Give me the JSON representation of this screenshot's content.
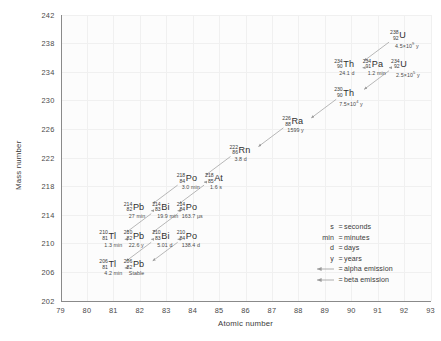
{
  "chart_data": {
    "type": "scatter",
    "title": "",
    "xlabel": "Atomic number",
    "ylabel": "Mass number",
    "xlim": [
      79,
      93
    ],
    "ylim": [
      202,
      242
    ],
    "xticks": [
      79,
      80,
      81,
      82,
      83,
      84,
      85,
      86,
      87,
      88,
      89,
      90,
      91,
      92,
      93
    ],
    "yticks": [
      202,
      206,
      210,
      214,
      218,
      222,
      226,
      230,
      234,
      238,
      242
    ],
    "grid": true,
    "legend_position": "lower-right",
    "points": [
      {
        "label": "U",
        "symbol": "U",
        "mass": 238,
        "z": 92,
        "half_life": "4.5×10⁹ y",
        "hl_base": "4.5×10",
        "hl_exp": "9",
        "hl_unit": " y"
      },
      {
        "label": "Th",
        "symbol": "Th",
        "mass": 234,
        "z": 90,
        "half_life": "24.1 d",
        "hl_base": "24.1 d",
        "hl_exp": "",
        "hl_unit": ""
      },
      {
        "label": "Pa",
        "symbol": "Pa",
        "mass": 234,
        "z": 91,
        "half_life": "1.2 min",
        "hl_base": "1.2 min",
        "hl_exp": "",
        "hl_unit": ""
      },
      {
        "label": "U",
        "symbol": "U",
        "mass": 234,
        "z": 92,
        "half_life": "2.5×10⁵ y",
        "hl_base": "2.5×10",
        "hl_exp": "5",
        "hl_unit": " y"
      },
      {
        "label": "Th",
        "symbol": "Th",
        "mass": 230,
        "z": 90,
        "half_life": "7.5×10⁴ y",
        "hl_base": "7.5×10",
        "hl_exp": "4",
        "hl_unit": " y"
      },
      {
        "label": "Ra",
        "symbol": "Ra",
        "mass": 226,
        "z": 88,
        "half_life": "1599 y",
        "hl_base": "1599 y",
        "hl_exp": "",
        "hl_unit": ""
      },
      {
        "label": "Rn",
        "symbol": "Rn",
        "mass": 222,
        "z": 86,
        "half_life": "3.8 d",
        "hl_base": "3.8 d",
        "hl_exp": "",
        "hl_unit": ""
      },
      {
        "label": "Po",
        "symbol": "Po",
        "mass": 218,
        "z": 84,
        "half_life": "3.0 min",
        "hl_base": "3.0 min",
        "hl_exp": "",
        "hl_unit": ""
      },
      {
        "label": "At",
        "symbol": "At",
        "mass": 218,
        "z": 85,
        "half_life": "1.6 s",
        "hl_base": "1.6 s",
        "hl_exp": "",
        "hl_unit": ""
      },
      {
        "label": "Pb",
        "symbol": "Pb",
        "mass": 214,
        "z": 82,
        "half_life": "27 min",
        "hl_base": "27 min",
        "hl_exp": "",
        "hl_unit": ""
      },
      {
        "label": "Bi",
        "symbol": "Bi",
        "mass": 214,
        "z": 83,
        "half_life": "19.9 min",
        "hl_base": "19.9 min",
        "hl_exp": "",
        "hl_unit": ""
      },
      {
        "label": "Po",
        "symbol": "Po",
        "mass": 214,
        "z": 84,
        "half_life": "163.7 µs",
        "hl_base": "163.7 µs",
        "hl_exp": "",
        "hl_unit": ""
      },
      {
        "label": "Tl",
        "symbol": "Tl",
        "mass": 210,
        "z": 81,
        "half_life": "1.3 min",
        "hl_base": "1.3 min",
        "hl_exp": "",
        "hl_unit": ""
      },
      {
        "label": "Pb",
        "symbol": "Pb",
        "mass": 210,
        "z": 82,
        "half_life": "22.6 y",
        "hl_base": "22.6 y",
        "hl_exp": "",
        "hl_unit": ""
      },
      {
        "label": "Bi",
        "symbol": "Bi",
        "mass": 210,
        "z": 83,
        "half_life": "5.01 d",
        "hl_base": "5.01 d",
        "hl_exp": "",
        "hl_unit": ""
      },
      {
        "label": "Po",
        "symbol": "Po",
        "mass": 210,
        "z": 84,
        "half_life": "138.4 d",
        "hl_base": "138.4 d",
        "hl_exp": "",
        "hl_unit": ""
      },
      {
        "label": "Tl",
        "symbol": "Tl",
        "mass": 206,
        "z": 81,
        "half_life": "4.2 min",
        "hl_base": "4.2 min",
        "hl_exp": "",
        "hl_unit": ""
      },
      {
        "label": "Pb",
        "symbol": "Pb",
        "mass": 206,
        "z": 82,
        "half_life": "Stable",
        "hl_base": "Stable",
        "hl_exp": "",
        "hl_unit": ""
      }
    ],
    "transitions": [
      {
        "from": "U-238",
        "to": "Th-234",
        "type": "alpha"
      },
      {
        "from": "Th-234",
        "to": "Pa-234",
        "type": "beta"
      },
      {
        "from": "Pa-234",
        "to": "U-234",
        "type": "beta"
      },
      {
        "from": "U-234",
        "to": "Th-230",
        "type": "alpha"
      },
      {
        "from": "Th-230",
        "to": "Ra-226",
        "type": "alpha"
      },
      {
        "from": "Ra-226",
        "to": "Rn-222",
        "type": "alpha"
      },
      {
        "from": "Rn-222",
        "to": "Po-218",
        "type": "alpha"
      },
      {
        "from": "Po-218",
        "to": "At-218",
        "type": "beta"
      },
      {
        "from": "Po-218",
        "to": "Pb-214",
        "type": "alpha"
      },
      {
        "from": "At-218",
        "to": "Bi-214",
        "type": "alpha"
      },
      {
        "from": "Pb-214",
        "to": "Bi-214",
        "type": "beta"
      },
      {
        "from": "Bi-214",
        "to": "Po-214",
        "type": "beta"
      },
      {
        "from": "Bi-214",
        "to": "Tl-210",
        "type": "alpha"
      },
      {
        "from": "Po-214",
        "to": "Pb-210",
        "type": "alpha"
      },
      {
        "from": "Tl-210",
        "to": "Pb-210",
        "type": "beta"
      },
      {
        "from": "Pb-210",
        "to": "Bi-210",
        "type": "beta"
      },
      {
        "from": "Bi-210",
        "to": "Po-210",
        "type": "beta"
      },
      {
        "from": "Bi-210",
        "to": "Tl-206",
        "type": "alpha"
      },
      {
        "from": "Po-210",
        "to": "Pb-206",
        "type": "alpha"
      },
      {
        "from": "Tl-206",
        "to": "Pb-206",
        "type": "beta"
      }
    ]
  },
  "axes": {
    "x_title": "Atomic number",
    "y_title": "Mass number",
    "x_ticks": [
      "79",
      "80",
      "81",
      "82",
      "83",
      "84",
      "85",
      "86",
      "87",
      "88",
      "89",
      "90",
      "91",
      "92",
      "93"
    ],
    "y_ticks": [
      "242",
      "238",
      "234",
      "230",
      "226",
      "222",
      "218",
      "214",
      "210",
      "206",
      "202"
    ]
  },
  "legend": {
    "units": [
      {
        "key": "s",
        "eq": "=",
        "value": "seconds"
      },
      {
        "key": "min",
        "eq": "=",
        "value": "minutes"
      },
      {
        "key": "d",
        "eq": "=",
        "value": "days"
      },
      {
        "key": "y",
        "eq": "=",
        "value": "years"
      }
    ],
    "emissions": [
      {
        "icon": "alpha-arrow-icon",
        "eq": "=",
        "value": "alpha emission"
      },
      {
        "icon": "beta-arrow-icon",
        "eq": "=",
        "value": "beta emission"
      }
    ]
  },
  "colors": {
    "background": "#ffffff",
    "plot_background": "#fcfcfc",
    "axis": "#8a8a8a",
    "grid": "#f0f0f0",
    "text": "#3a3a3a",
    "arrow": "#9a9a9a"
  }
}
